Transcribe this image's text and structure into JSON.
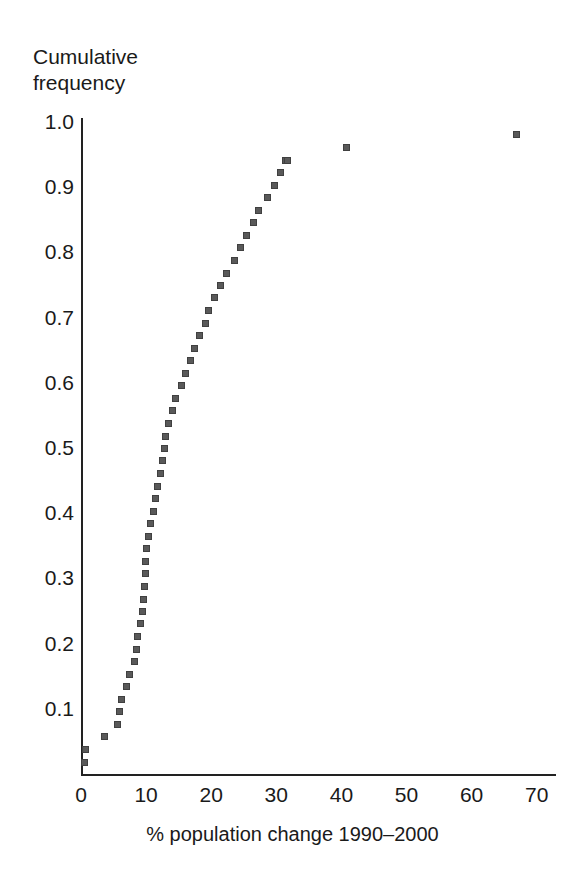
{
  "chart_data": {
    "type": "scatter",
    "title": "",
    "subtitle": "",
    "xlabel": "% population change 1990–2000",
    "ylabel": "Cumulative frequency",
    "ylabel_lines": [
      "Cumulative",
      "frequency"
    ],
    "xlim": [
      0,
      70
    ],
    "ylim": [
      0,
      1.0
    ],
    "xticks": [
      0,
      10,
      20,
      30,
      40,
      50,
      60,
      70
    ],
    "xtick_labels": [
      "0",
      "10",
      "20",
      "30",
      "40",
      "50",
      "60",
      "70"
    ],
    "yticks": [
      0.1,
      0.2,
      0.3,
      0.4,
      0.5,
      0.6,
      0.7,
      0.8,
      0.9,
      1.0
    ],
    "ytick_labels": [
      "0.1",
      "0.2",
      "0.3",
      "0.4",
      "0.5",
      "0.6",
      "0.7",
      "0.8",
      "0.9",
      "1.0"
    ],
    "grid": false,
    "legend": null,
    "marker": "open-square",
    "marker_color": "#404040",
    "series": [
      {
        "name": "Cumulative frequency",
        "x": [
          0.5,
          0.6,
          3.6,
          5.5,
          5.9,
          6.2,
          6.9,
          7.4,
          8.1,
          8.4,
          8.6,
          9.0,
          9.3,
          9.5,
          9.7,
          9.8,
          9.9,
          10.0,
          10.3,
          10.6,
          11.0,
          11.4,
          11.7,
          12.1,
          12.4,
          12.7,
          12.9,
          13.3,
          14.0,
          14.4,
          15.3,
          16.0,
          16.7,
          17.4,
          18.2,
          19.0,
          19.5,
          20.4,
          21.4,
          22.3,
          23.5,
          24.4,
          25.4,
          26.4,
          27.2,
          28.5,
          29.6,
          30.5,
          31.3,
          31.6,
          40.7,
          66.8
        ],
        "y": [
          0.019,
          0.038,
          0.058,
          0.077,
          0.096,
          0.115,
          0.135,
          0.154,
          0.173,
          0.192,
          0.212,
          0.231,
          0.25,
          0.269,
          0.288,
          0.308,
          0.327,
          0.346,
          0.365,
          0.385,
          0.404,
          0.423,
          0.442,
          0.462,
          0.481,
          0.5,
          0.519,
          0.538,
          0.558,
          0.577,
          0.596,
          0.615,
          0.635,
          0.654,
          0.673,
          0.692,
          0.712,
          0.731,
          0.75,
          0.769,
          0.788,
          0.808,
          0.827,
          0.846,
          0.865,
          0.885,
          0.904,
          0.923,
          0.942,
          0.942,
          0.962,
          0.981
        ]
      }
    ]
  }
}
